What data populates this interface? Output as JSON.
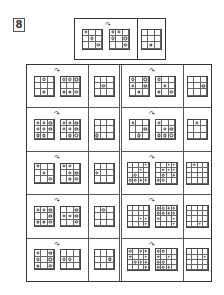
{
  "problem": {
    "number": "8",
    "arrow_glyph": "↷"
  },
  "example": {
    "first": {
      "size": 3,
      "dots": [
        [
          0,
          0
        ],
        [
          1,
          1
        ],
        [
          2,
          2
        ]
      ]
    },
    "second": {
      "size": 3,
      "dots": [
        [
          0,
          0
        ],
        [
          0,
          1
        ],
        [
          1,
          0
        ],
        [
          1,
          2
        ],
        [
          2,
          2
        ]
      ]
    },
    "answer": {
      "size": 3,
      "dots": [
        [
          2,
          1
        ]
      ]
    }
  },
  "rows": [
    {
      "left": {
        "first": {
          "size": 3,
          "dots": [
            [
              0,
              1
            ],
            [
              2,
              1
            ]
          ]
        },
        "second": {
          "size": 3,
          "dots": [
            [
              0,
              0
            ],
            [
              0,
              1
            ],
            [
              0,
              2
            ],
            [
              2,
              0
            ],
            [
              2,
              1
            ],
            [
              2,
              2
            ]
          ]
        },
        "answer": {
          "size": 3,
          "dots": [
            [
              1,
              1
            ]
          ]
        }
      },
      "right": {
        "first": {
          "size": 3,
          "dots": [
            [
              0,
              0
            ],
            [
              0,
              2
            ],
            [
              1,
              0
            ],
            [
              1,
              2
            ],
            [
              2,
              1
            ]
          ]
        },
        "second": {
          "size": 3,
          "dots": [
            [
              0,
              0
            ],
            [
              1,
              1
            ],
            [
              2,
              0
            ],
            [
              2,
              2
            ]
          ]
        },
        "answer": {
          "size": 3,
          "dots": [
            [
              1,
              2
            ]
          ]
        }
      }
    },
    {
      "left": {
        "first": {
          "size": 3,
          "dots": [
            [
              0,
              0
            ],
            [
              0,
              1
            ],
            [
              0,
              2
            ],
            [
              1,
              0
            ],
            [
              1,
              1
            ],
            [
              1,
              2
            ],
            [
              2,
              0
            ],
            [
              2,
              1
            ]
          ]
        },
        "second": {
          "size": 3,
          "dots": [
            [
              0,
              0
            ],
            [
              0,
              1
            ],
            [
              0,
              2
            ],
            [
              1,
              0
            ],
            [
              1,
              1
            ],
            [
              1,
              2
            ],
            [
              2,
              1
            ],
            [
              2,
              2
            ]
          ]
        },
        "answer": {
          "size": 3,
          "dots": [
            [
              2,
              0
            ]
          ]
        }
      },
      "right": {
        "first": {
          "size": 3,
          "dots": [
            [
              0,
              0
            ],
            [
              1,
              2
            ],
            [
              2,
              1
            ]
          ]
        },
        "second": {
          "size": 3,
          "dots": [
            [
              0,
              0
            ],
            [
              1,
              1
            ],
            [
              1,
              2
            ],
            [
              2,
              0
            ],
            [
              2,
              1
            ],
            [
              2,
              2
            ]
          ]
        },
        "answer": {
          "size": 3,
          "dots": [
            [
              0,
              1
            ]
          ]
        }
      }
    },
    {
      "left": {
        "first": {
          "size": 3,
          "dots": [
            [
              0,
              0
            ],
            [
              1,
              1
            ],
            [
              2,
              2
            ]
          ]
        },
        "second": {
          "size": 3,
          "dots": [
            [
              0,
              0
            ],
            [
              0,
              1
            ],
            [
              1,
              1
            ],
            [
              1,
              2
            ],
            [
              2,
              1
            ],
            [
              2,
              2
            ]
          ]
        },
        "answer": {
          "size": 3,
          "dots": [
            [
              1,
              0
            ]
          ]
        }
      },
      "right": {
        "first": {
          "size": 4,
          "dots": [
            [
              0,
              3
            ],
            [
              1,
              2
            ],
            [
              2,
              1
            ],
            [
              3,
              0
            ],
            [
              3,
              1
            ],
            [
              3,
              2
            ],
            [
              3,
              3
            ]
          ]
        },
        "second": {
          "size": 4,
          "dots": [
            [
              0,
              2
            ],
            [
              0,
              3
            ],
            [
              1,
              1
            ],
            [
              1,
              2
            ],
            [
              1,
              3
            ],
            [
              2,
              1
            ],
            [
              2,
              3
            ],
            [
              3,
              0
            ],
            [
              3,
              1
            ]
          ]
        },
        "answer": {
          "size": 4,
          "dots": [
            [
              0,
              1
            ]
          ]
        }
      }
    },
    {
      "left": {
        "first": {
          "size": 3,
          "dots": [
            [
              0,
              0
            ],
            [
              0,
              1
            ],
            [
              0,
              2
            ],
            [
              1,
              2
            ],
            [
              2,
              0
            ],
            [
              2,
              1
            ],
            [
              2,
              2
            ]
          ]
        },
        "second": {
          "size": 3,
          "dots": [
            [
              0,
              2
            ],
            [
              1,
              0
            ],
            [
              1,
              1
            ],
            [
              1,
              2
            ],
            [
              2,
              2
            ]
          ]
        },
        "answer": {
          "size": 3,
          "dots": [
            [
              0,
              1
            ]
          ]
        }
      },
      "right": {
        "first": {
          "size": 4,
          "dots": [
            [
              2,
              2
            ],
            [
              2,
              3
            ],
            [
              3,
              3
            ]
          ]
        },
        "second": {
          "size": 4,
          "dots": [
            [
              0,
              0
            ],
            [
              0,
              1
            ],
            [
              0,
              2
            ],
            [
              0,
              3
            ],
            [
              1,
              0
            ],
            [
              1,
              1
            ],
            [
              1,
              2
            ],
            [
              1,
              3
            ],
            [
              2,
              0
            ],
            [
              2,
              3
            ],
            [
              3,
              3
            ]
          ]
        },
        "answer": {
          "size": 4,
          "dots": [
            [
              3,
              2
            ]
          ]
        }
      }
    },
    {
      "left": {
        "first": {
          "size": 3,
          "dots": [
            [
              0,
              0
            ],
            [
              0,
              2
            ],
            [
              1,
              0
            ],
            [
              1,
              2
            ],
            [
              2,
              0
            ],
            [
              2,
              2
            ]
          ]
        },
        "second": {
          "size": 3,
          "dots": [
            [
              1,
              0
            ],
            [
              1,
              1
            ]
          ]
        },
        "answer": {
          "size": 3,
          "dots": [
            [
              1,
              2
            ]
          ]
        }
      },
      "right": {
        "first": {
          "size": 4,
          "dots": [
            [
              0,
              0
            ],
            [
              0,
              2
            ],
            [
              0,
              3
            ],
            [
              1,
              0
            ],
            [
              1,
              3
            ],
            [
              2,
              1
            ],
            [
              2,
              2
            ],
            [
              2,
              3
            ],
            [
              3,
              3
            ]
          ]
        },
        "second": {
          "size": 4,
          "dots": [
            [
              0,
              0
            ],
            [
              0,
              1
            ],
            [
              1,
              0
            ],
            [
              1,
              2
            ],
            [
              2,
              0
            ],
            [
              2,
              1
            ],
            [
              3,
              0
            ],
            [
              3,
              1
            ],
            [
              3,
              2
            ]
          ]
        },
        "answer": {
          "size": 4,
          "dots": [
            [
              1,
              3
            ]
          ]
        }
      }
    }
  ]
}
